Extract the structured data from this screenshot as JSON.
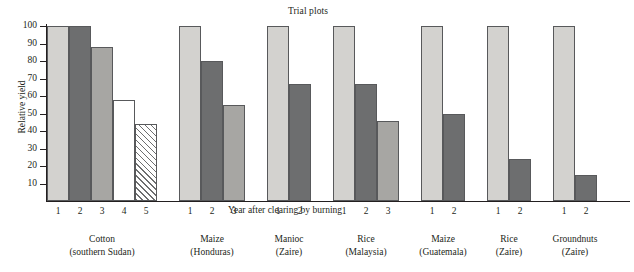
{
  "chart_data": {
    "type": "bar",
    "title": "Trial plots",
    "xlabel": "Year after clearing by burning",
    "ylabel": "Relative yield",
    "ylim": [
      0,
      100
    ],
    "yticks": [
      10,
      20,
      30,
      40,
      50,
      60,
      70,
      80,
      90,
      100
    ],
    "grid": false,
    "legend": "none",
    "groups": [
      {
        "crop": "Cotton",
        "location": "(southern Sudan)",
        "categories": [
          "1",
          "2",
          "3",
          "4",
          "5"
        ],
        "values": [
          100,
          100,
          88,
          58,
          44
        ],
        "fills": [
          "light",
          "dark",
          "medium",
          "white",
          "hatch"
        ]
      },
      {
        "crop": "Maize",
        "location": "(Honduras)",
        "categories": [
          "1",
          "2",
          "3"
        ],
        "values": [
          100,
          80,
          55
        ],
        "fills": [
          "light",
          "dark",
          "medium"
        ]
      },
      {
        "crop": "Manioc",
        "location": "(Zaire)",
        "categories": [
          "1",
          "2"
        ],
        "values": [
          100,
          67
        ],
        "fills": [
          "light",
          "dark"
        ]
      },
      {
        "crop": "Rice",
        "location": "(Malaysia)",
        "categories": [
          "1",
          "2",
          "3"
        ],
        "values": [
          100,
          67,
          46
        ],
        "fills": [
          "light",
          "dark",
          "medium"
        ]
      },
      {
        "crop": "Maize",
        "location": "(Guatemala)",
        "categories": [
          "1",
          "2"
        ],
        "values": [
          100,
          50
        ],
        "fills": [
          "light",
          "dark"
        ]
      },
      {
        "crop": "Rice",
        "location": "(Zaire)",
        "categories": [
          "1",
          "2"
        ],
        "values": [
          100,
          24
        ],
        "fills": [
          "light",
          "dark"
        ]
      },
      {
        "crop": "Groundnuts",
        "location": "(Zaire)",
        "categories": [
          "1",
          "2"
        ],
        "values": [
          100,
          15
        ],
        "fills": [
          "light",
          "dark"
        ]
      }
    ],
    "colors": {
      "light": "#d3d2cf",
      "medium": "#a7a6a3",
      "dark": "#6d6e6f",
      "white": "#ffffff",
      "outline": "#58595b",
      "text": "#231f20"
    }
  },
  "bottom_caption": ""
}
